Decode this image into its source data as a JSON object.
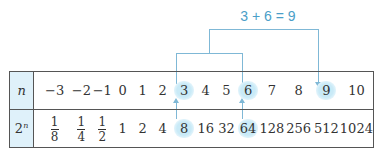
{
  "caption_cut": "",
  "equation": "3 + 6 = 9",
  "table": {
    "row_headers": [
      "n",
      "2ⁿ"
    ],
    "n_values": [
      "−3",
      "−2",
      "−1",
      "0",
      "1",
      "2",
      "3",
      "4",
      "5",
      "6",
      "7",
      "8",
      "9",
      "10"
    ],
    "pow_values": [
      {
        "num": "1",
        "den": "8"
      },
      {
        "num": "1",
        "den": "4"
      },
      {
        "num": "1",
        "den": "2"
      },
      "1",
      "2",
      "4",
      "8",
      "16",
      "32",
      "64",
      "128",
      "256",
      "512",
      "1024"
    ],
    "highlighted_n": [
      "3",
      "6",
      "9"
    ],
    "highlighted_pow": [
      "8",
      "64"
    ]
  },
  "colors": {
    "accent": "#4a9ec8",
    "connector": "#7fb8d6",
    "highlight": "#c9eaf7",
    "header_bg": "#dff1fa",
    "border": "#555555"
  }
}
